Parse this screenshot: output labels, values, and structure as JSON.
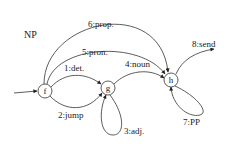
{
  "title": "NP",
  "nodes": [
    {
      "id": "f",
      "label": "f",
      "x": 45,
      "y": 91,
      "r": 7
    },
    {
      "id": "g",
      "label": "g",
      "x": 108,
      "y": 88,
      "r": 7
    },
    {
      "id": "h",
      "label": "h",
      "x": 171,
      "y": 80,
      "r": 7
    }
  ],
  "edges": [
    {
      "id": "e1",
      "label": "1:det.",
      "from": "f",
      "to": "g"
    },
    {
      "id": "e2",
      "label": "2:jump",
      "from": "f",
      "to": "g"
    },
    {
      "id": "e3",
      "label": "3:adj.",
      "from": "g",
      "to": "g"
    },
    {
      "id": "e4",
      "label": "4:noun",
      "from": "g",
      "to": "h"
    },
    {
      "id": "e5",
      "label": "5:pron.",
      "from": "f",
      "to": "h"
    },
    {
      "id": "e6",
      "label": "6:prop.",
      "from": "f",
      "to": "h"
    },
    {
      "id": "e7",
      "label": "7:PP",
      "from": "h",
      "to": "h"
    },
    {
      "id": "e8",
      "label": "8:send",
      "from": "h",
      "to": "exit"
    }
  ],
  "colors": {
    "stroke": "#333333",
    "background": "#ffffff"
  }
}
